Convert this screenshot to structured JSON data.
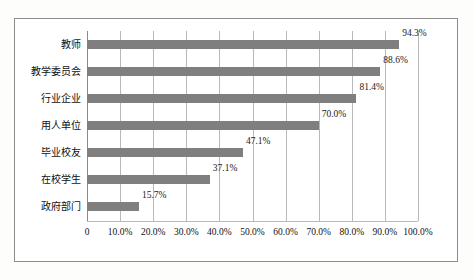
{
  "chart_data": {
    "type": "bar",
    "orientation": "horizontal",
    "title": "",
    "xlabel": "",
    "ylabel": "",
    "categories": [
      "教师",
      "教学委员会",
      "行业企业",
      "用人单位",
      "毕业校友",
      "在校学生",
      "政府部门"
    ],
    "values": [
      94.3,
      88.6,
      81.4,
      70.0,
      47.1,
      37.1,
      15.7
    ],
    "data_labels": [
      "94.3%",
      "88.6%",
      "81.4%",
      "70.0%",
      "47.1%",
      "37.1%",
      "15.7%"
    ],
    "xlim": [
      0,
      100
    ],
    "xticks": [
      0,
      10,
      20,
      30,
      40,
      50,
      60,
      70,
      80,
      90,
      100
    ],
    "xtick_labels": [
      "0",
      "10.0%",
      "20.0%",
      "30.0%",
      "40.0%",
      "50.0%",
      "60.0%",
      "70.0%",
      "80.0%",
      "90.0%",
      "100.0%"
    ],
    "grid": true,
    "grid_axis": "x",
    "legend": false,
    "bar_color": "#7f7f7f",
    "grid_color": "#b9b9b9",
    "frame_color": "#8d8d8d",
    "background_color": "#ffffff"
  },
  "caption": ""
}
